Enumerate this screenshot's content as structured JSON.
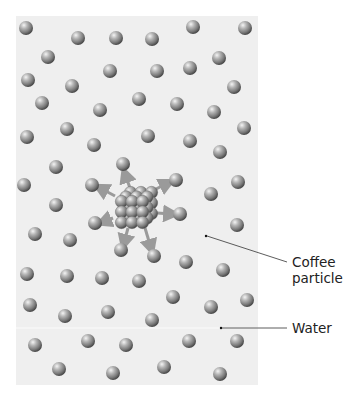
{
  "figure": {
    "labels": {
      "coffee_line1": "Coffee",
      "coffee_line2": "particle",
      "water": "Water"
    },
    "colors": {
      "panel_background": "#efefef",
      "particle_fill": "#8c8c8c",
      "arrow": "#9a9a9a",
      "leader_line": "#333333"
    },
    "cluster": {
      "cx": 136,
      "cy": 208,
      "rows": 3,
      "cols": 3,
      "depth": 3
    },
    "arrows": [
      {
        "x1": 130,
        "y1": 188,
        "x2": 125,
        "y2": 174
      },
      {
        "x1": 150,
        "y1": 192,
        "x2": 168,
        "y2": 183
      },
      {
        "x1": 115,
        "y1": 196,
        "x2": 100,
        "y2": 188
      },
      {
        "x1": 157,
        "y1": 213,
        "x2": 172,
        "y2": 214
      },
      {
        "x1": 113,
        "y1": 218,
        "x2": 103,
        "y2": 222
      },
      {
        "x1": 128,
        "y1": 228,
        "x2": 124,
        "y2": 243
      },
      {
        "x1": 145,
        "y1": 228,
        "x2": 151,
        "y2": 248
      }
    ],
    "water_particles": [
      [
        26,
        28
      ],
      [
        78,
        38
      ],
      [
        116,
        38
      ],
      [
        152,
        39
      ],
      [
        193,
        27
      ],
      [
        245,
        28
      ],
      [
        48,
        57
      ],
      [
        110,
        71
      ],
      [
        157,
        71
      ],
      [
        190,
        68
      ],
      [
        219,
        58
      ],
      [
        28,
        80
      ],
      [
        72,
        86
      ],
      [
        234,
        87
      ],
      [
        42,
        103
      ],
      [
        139,
        99
      ],
      [
        177,
        104
      ],
      [
        100,
        110
      ],
      [
        214,
        112
      ],
      [
        27,
        137
      ],
      [
        67,
        129
      ],
      [
        148,
        136
      ],
      [
        190,
        141
      ],
      [
        244,
        128
      ],
      [
        94,
        145
      ],
      [
        220,
        152
      ],
      [
        56,
        167
      ],
      [
        123,
        164
      ],
      [
        24,
        185
      ],
      [
        92,
        185
      ],
      [
        176,
        180
      ],
      [
        238,
        182
      ],
      [
        211,
        194
      ],
      [
        56,
        205
      ],
      [
        95,
        223
      ],
      [
        180,
        214
      ],
      [
        237,
        225
      ],
      [
        35,
        234
      ],
      [
        70,
        240
      ],
      [
        121,
        250
      ],
      [
        154,
        256
      ],
      [
        186,
        262
      ],
      [
        223,
        270
      ],
      [
        27,
        274
      ],
      [
        67,
        276
      ],
      [
        102,
        278
      ],
      [
        139,
        281
      ],
      [
        173,
        297
      ],
      [
        211,
        307
      ],
      [
        247,
        300
      ],
      [
        30,
        305
      ],
      [
        65,
        316
      ],
      [
        108,
        312
      ],
      [
        152,
        320
      ],
      [
        35,
        345
      ],
      [
        88,
        341
      ],
      [
        126,
        345
      ],
      [
        189,
        341
      ],
      [
        237,
        341
      ],
      [
        59,
        369
      ],
      [
        113,
        373
      ],
      [
        164,
        367
      ],
      [
        220,
        374
      ]
    ],
    "coffee_particle_marker": {
      "x": 206,
      "y": 236
    },
    "water_marker": {
      "x": 221,
      "y": 328
    },
    "coffee_leader": {
      "x1": 207,
      "y1": 236,
      "x2": 287,
      "y2": 262
    },
    "water_leader": {
      "x1": 221,
      "y1": 328,
      "x2": 287,
      "y2": 328
    }
  }
}
